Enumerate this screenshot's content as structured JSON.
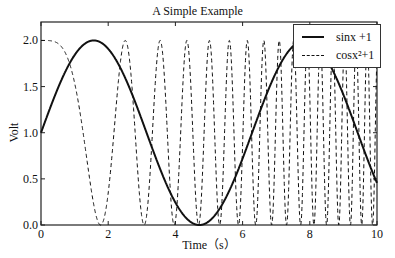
{
  "chart_data": {
    "type": "line",
    "title": "A Simple Example",
    "xlabel": "Time（s）",
    "ylabel": "Volt",
    "xlim": [
      0,
      10
    ],
    "ylim": [
      0,
      2.2
    ],
    "xticks": [
      "0",
      "2",
      "4",
      "6",
      "8",
      "10"
    ],
    "yticks": [
      "0.0",
      "0.5",
      "1.0",
      "1.5",
      "2.0"
    ],
    "grid": false,
    "legend_position": "upper right",
    "series": [
      {
        "name": "sinx +1",
        "function": "sin(x)+1",
        "style": "solid",
        "color": "#111111",
        "linewidth": 2
      },
      {
        "name": "cosx²+1",
        "function": "cos(x^2)+1",
        "style": "dashed",
        "color": "#111111",
        "linewidth": 1
      }
    ]
  },
  "legend": {
    "items": [
      "sinx +1",
      "cosx²+1"
    ]
  }
}
